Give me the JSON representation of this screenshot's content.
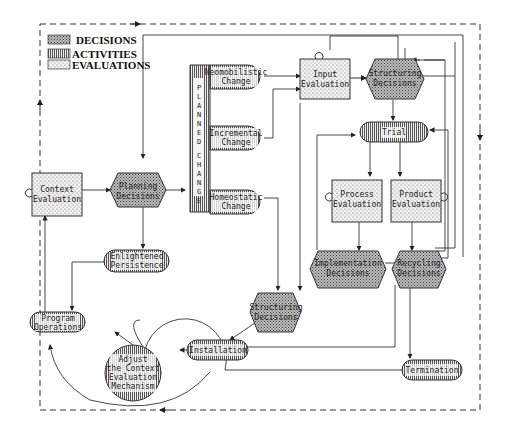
{
  "legend": {
    "items": [
      {
        "label": "DECISIONS",
        "pattern": "decision"
      },
      {
        "label": "ACTIVITIES",
        "pattern": "activity"
      },
      {
        "label": "EVALUATIONS",
        "pattern": "evaluation"
      }
    ]
  },
  "nodes": {
    "context_evaluation": [
      "Context",
      "Evaluation"
    ],
    "planning_decisions": [
      "Planning",
      "Decisions"
    ],
    "planned_change_label": "PLANNED CHANGE",
    "neomobilistic_change": [
      "Neomobilistic",
      "Change"
    ],
    "incremental_change": [
      "Incremental",
      "Change"
    ],
    "homeostatic_change": [
      "Homeostatic",
      "Change"
    ],
    "input_evaluation": [
      "Input",
      "Evaluation"
    ],
    "structuring_decisions_top": [
      "Structuring",
      "Decisions"
    ],
    "trial": [
      "Trial"
    ],
    "process_evaluation": [
      "Process",
      "Evaluation"
    ],
    "product_evaluation": [
      "Product",
      "Evaluation"
    ],
    "implementation_decisions": [
      "Implementation",
      "Decisions"
    ],
    "recycling_decisions": [
      "Recycling",
      "Decisions"
    ],
    "enlightened_persistence": [
      "Enlightened",
      "Persistence"
    ],
    "structuring_decisions_bottom": [
      "Structuring",
      "Decisions"
    ],
    "program_operations": [
      "Program",
      "Operations"
    ],
    "adjust_mechanism": [
      "Adjust",
      "the Context",
      "Evaluation",
      "Mechanism"
    ],
    "installation": [
      "Installation"
    ],
    "termination": [
      "Termination"
    ]
  },
  "colors": {
    "ink": "#222222",
    "background": "#ffffff"
  }
}
